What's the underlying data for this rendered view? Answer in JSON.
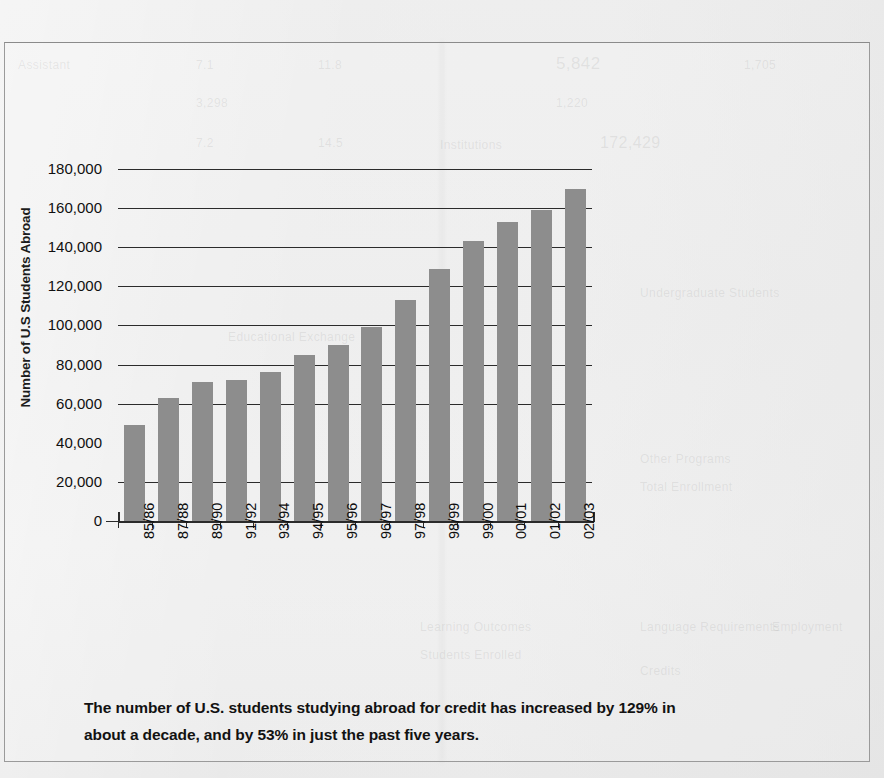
{
  "chart_data": {
    "type": "bar",
    "title": "",
    "xlabel": "",
    "ylabel": "Number of U.S Students Abroad",
    "ylim": [
      0,
      180000
    ],
    "ytick_step": 20000,
    "grid": true,
    "legend": "none",
    "bar_color": "#8d8d8d",
    "categories": [
      "85/86",
      "87/88",
      "89/90",
      "91/92",
      "93/94",
      "94/95",
      "95/96",
      "96/97",
      "97/98",
      "98/99",
      "99/00",
      "00/01",
      "01/02",
      "02/03"
    ],
    "values": [
      49000,
      63000,
      71000,
      72000,
      76000,
      85000,
      90000,
      99000,
      113000,
      129000,
      143000,
      153000,
      159000,
      170000
    ],
    "ytick_labels": [
      "180,000",
      "160,000",
      "140,000",
      "120,000",
      "100,000",
      "80,000",
      "60,000",
      "40,000",
      "20,000",
      "0"
    ],
    "ytick_values": [
      180000,
      160000,
      140000,
      120000,
      100000,
      80000,
      60000,
      40000,
      20000,
      0
    ],
    "gridline_values": [
      180000,
      160000,
      140000,
      120000,
      100000,
      80000,
      60000,
      20000
    ],
    "annotations": []
  },
  "caption": {
    "line1": "The number of U.S. students studying abroad for credit has increased by 129% in",
    "line2": "about a decade, and by 53% in just the past five years."
  },
  "ghost_text": {
    "g1": "Assistant",
    "g2": "7.1",
    "g3": "11.8",
    "g4": "5,842",
    "g5": "1,705",
    "g6": "3,298",
    "g7": "1,220",
    "g8": "7.2",
    "g9": "14.5",
    "g10": "Institutions",
    "g11": "172,429",
    "g12": "Educational Exchange",
    "g13": "Undergraduate Students",
    "g14": "Other Programs",
    "g15": "Total Enrollment",
    "g16": "Language Requirements",
    "g17": "Credits",
    "g18": "Employment",
    "g19": "Learning Outcomes",
    "g20": "Students Enrolled"
  }
}
